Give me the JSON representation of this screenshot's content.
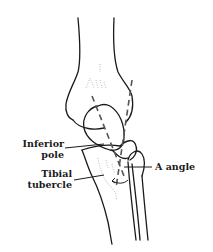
{
  "figure": {
    "labels": {
      "inferior_pole": [
        "Inferior",
        "pole"
      ],
      "tibial_tubercle": [
        "Tibial",
        "tubercle"
      ],
      "a_angle": "A angle"
    },
    "colors": {
      "line": "#1a1a1a",
      "dashed_axis": "#555555",
      "background": "#ffffff"
    }
  }
}
